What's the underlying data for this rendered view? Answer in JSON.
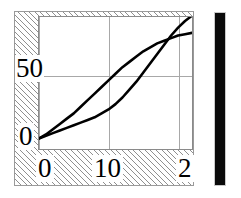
{
  "figure": {
    "background_color": "#ffffff",
    "frame_color": "#9a9a9a",
    "hatch_pattern": "diagonal-45-hatch",
    "right_bar": {
      "name": "colorbar",
      "color": "#0a0a0a"
    }
  },
  "chart_data": {
    "type": "line",
    "title": "",
    "xlabel": "",
    "ylabel": "",
    "xlim": [
      0,
      22
    ],
    "ylim": [
      -8,
      92
    ],
    "grid": true,
    "legend": null,
    "xticks": [
      0,
      10,
      20
    ],
    "xticklabels": [
      "0",
      "10",
      "2"
    ],
    "yticks": [
      0,
      50
    ],
    "yticklabels": [
      "0",
      "50"
    ],
    "series": [
      {
        "name": "upper-curve",
        "color": "#000000",
        "x": [
          0,
          1,
          2,
          3,
          4,
          5,
          6,
          7,
          8,
          9,
          10,
          11,
          12,
          13,
          14,
          15,
          16,
          17,
          18,
          19,
          20,
          21,
          22
        ],
        "y": [
          0,
          3,
          7,
          11,
          15,
          19,
          24,
          29,
          34,
          39,
          44,
          49,
          54,
          58,
          62,
          66,
          69,
          72,
          74,
          76,
          78,
          79,
          80
        ]
      },
      {
        "name": "lower-curve",
        "color": "#000000",
        "x": [
          0,
          1,
          2,
          3,
          4,
          5,
          6,
          7,
          8,
          9,
          10,
          11,
          12,
          13,
          14,
          15,
          16,
          17,
          18,
          19,
          20,
          21,
          22
        ],
        "y": [
          0,
          2,
          4,
          6,
          8,
          10,
          12,
          14,
          16,
          19,
          22,
          26,
          31,
          37,
          43,
          50,
          57,
          64,
          71,
          78,
          84,
          89,
          93
        ]
      }
    ]
  },
  "labels": {
    "y_50": "50",
    "y_0": "0",
    "x_0": "0",
    "x_10": "10",
    "x_20": "2"
  }
}
